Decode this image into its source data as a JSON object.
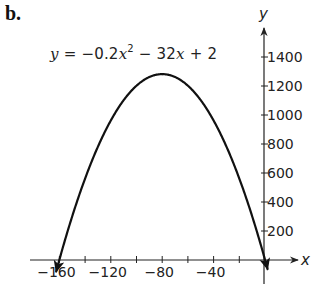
{
  "panel_label": "b.",
  "equation": {
    "y": "y",
    "eq": " = −0.2",
    "x1": "x",
    "exp": "2",
    "rest": " − 32",
    "x2": "x",
    "tail": " + 2"
  },
  "chart_data": {
    "type": "line",
    "function": "y = -0.2x^2 - 32x + 2",
    "xlabel": "x",
    "ylabel": "y",
    "xlim": [
      -170,
      25
    ],
    "ylim": [
      -170,
      1600
    ],
    "x_ticks": [
      -160,
      -140,
      -120,
      -100,
      -80,
      -60,
      -40,
      -20
    ],
    "x_tick_labels": [
      "−160",
      "−120",
      "−80",
      "−40"
    ],
    "x_tick_label_values": [
      -160,
      -120,
      -80,
      -40
    ],
    "y_ticks": [
      200,
      400,
      600,
      800,
      1000,
      1200,
      1400
    ],
    "y_tick_labels": [
      "200",
      "400",
      "600",
      "800",
      "1000",
      "1200",
      "1400"
    ],
    "vertex": {
      "x": -80,
      "y": 1282
    },
    "x_intercepts": [
      -160.06,
      0.06
    ],
    "y_intercept": 2,
    "x": [
      -162,
      -160,
      -140,
      -120,
      -100,
      -80,
      -60,
      -40,
      -20,
      0,
      1.8
    ],
    "y": [
      -62.8,
      2,
      562,
      962,
      1202,
      1282,
      1202,
      962,
      562,
      2,
      -56.3
    ],
    "grid": false,
    "legend": null,
    "arrows_on_curve_ends": true
  },
  "axes": {
    "x_label": "x",
    "y_label": "y"
  }
}
